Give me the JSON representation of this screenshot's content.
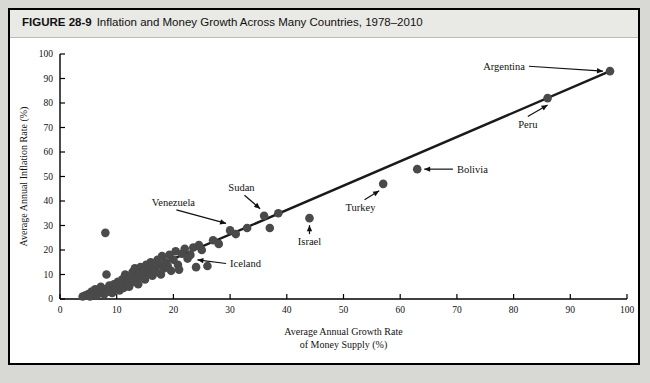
{
  "figure": {
    "number_label": "FIGURE 28-9",
    "title": "Inflation and Money Growth Across Many Countries, 1978–2010"
  },
  "colors": {
    "page_background": "#d8d8d4",
    "figure_background": "#ffffff",
    "header_band": "#e9e9e6",
    "border": "#000000",
    "dot": "#4a4a4a",
    "trend_line": "#1a1a1a",
    "text": "#111111"
  },
  "chart_data": {
    "type": "scatter",
    "title": "Inflation and Money Growth Across Many Countries, 1978–2010",
    "xlabel": "Average Annual Growth Rate of Money Supply (%)",
    "xlabel_line1": "Average Annual Growth Rate",
    "xlabel_line2": "of Money Supply (%)",
    "ylabel": "Average Annual Inflation Rate (%)",
    "xlim": [
      0,
      100
    ],
    "ylim": [
      0,
      100
    ],
    "xticks": [
      0,
      10,
      20,
      30,
      40,
      50,
      60,
      70,
      80,
      90,
      100
    ],
    "yticks": [
      0,
      10,
      20,
      30,
      40,
      50,
      60,
      70,
      80,
      90,
      100
    ],
    "grid": false,
    "legend": "none",
    "trend_line": {
      "label": "fitted line",
      "x": [
        4,
        97
      ],
      "y": [
        0.5,
        93
      ]
    },
    "points": [
      {
        "x": 4.0,
        "y": 1.0
      },
      {
        "x": 4.5,
        "y": 1.5
      },
      {
        "x": 5.0,
        "y": 2.0
      },
      {
        "x": 5.3,
        "y": 1.0
      },
      {
        "x": 5.6,
        "y": 3.0
      },
      {
        "x": 6.0,
        "y": 2.0
      },
      {
        "x": 6.2,
        "y": 4.0
      },
      {
        "x": 6.5,
        "y": 1.5
      },
      {
        "x": 6.8,
        "y": 3.0
      },
      {
        "x": 7.0,
        "y": 2.5
      },
      {
        "x": 7.2,
        "y": 5.0
      },
      {
        "x": 7.5,
        "y": 3.5
      },
      {
        "x": 7.8,
        "y": 2.0
      },
      {
        "x": 8.0,
        "y": 4.0
      },
      {
        "x": 8.0,
        "y": 27.0
      },
      {
        "x": 8.2,
        "y": 10.0
      },
      {
        "x": 8.4,
        "y": 3.0
      },
      {
        "x": 8.7,
        "y": 5.5
      },
      {
        "x": 9.0,
        "y": 4.5
      },
      {
        "x": 9.2,
        "y": 2.5
      },
      {
        "x": 9.5,
        "y": 6.0
      },
      {
        "x": 9.8,
        "y": 4.0
      },
      {
        "x": 10.0,
        "y": 5.0
      },
      {
        "x": 10.2,
        "y": 7.0
      },
      {
        "x": 10.5,
        "y": 3.5
      },
      {
        "x": 10.8,
        "y": 6.0
      },
      {
        "x": 11.0,
        "y": 8.0
      },
      {
        "x": 11.2,
        "y": 4.5
      },
      {
        "x": 11.5,
        "y": 10.0
      },
      {
        "x": 11.8,
        "y": 6.5
      },
      {
        "x": 12.0,
        "y": 7.5
      },
      {
        "x": 12.2,
        "y": 5.0
      },
      {
        "x": 12.5,
        "y": 9.0
      },
      {
        "x": 12.8,
        "y": 11.0
      },
      {
        "x": 13.0,
        "y": 7.0
      },
      {
        "x": 13.2,
        "y": 12.5
      },
      {
        "x": 13.5,
        "y": 8.5
      },
      {
        "x": 13.8,
        "y": 6.0
      },
      {
        "x": 14.0,
        "y": 10.0
      },
      {
        "x": 14.2,
        "y": 13.0
      },
      {
        "x": 14.5,
        "y": 9.0
      },
      {
        "x": 14.8,
        "y": 11.5
      },
      {
        "x": 15.0,
        "y": 8.0
      },
      {
        "x": 15.2,
        "y": 14.0
      },
      {
        "x": 15.5,
        "y": 10.5
      },
      {
        "x": 15.8,
        "y": 12.0
      },
      {
        "x": 16.0,
        "y": 15.0
      },
      {
        "x": 16.3,
        "y": 9.5
      },
      {
        "x": 16.6,
        "y": 13.0
      },
      {
        "x": 17.0,
        "y": 11.0
      },
      {
        "x": 17.2,
        "y": 16.0
      },
      {
        "x": 17.5,
        "y": 14.0
      },
      {
        "x": 17.8,
        "y": 10.0
      },
      {
        "x": 18.0,
        "y": 17.5
      },
      {
        "x": 18.3,
        "y": 12.5
      },
      {
        "x": 18.6,
        "y": 15.0
      },
      {
        "x": 19.0,
        "y": 13.5
      },
      {
        "x": 19.3,
        "y": 18.0
      },
      {
        "x": 19.6,
        "y": 11.5
      },
      {
        "x": 20.0,
        "y": 16.0
      },
      {
        "x": 20.4,
        "y": 19.5
      },
      {
        "x": 20.8,
        "y": 14.0
      },
      {
        "x": 21.0,
        "y": 12.0
      },
      {
        "x": 21.5,
        "y": 18.5
      },
      {
        "x": 22.0,
        "y": 20.5
      },
      {
        "x": 22.5,
        "y": 16.5
      },
      {
        "x": 23.0,
        "y": 18.0
      },
      {
        "x": 23.5,
        "y": 21.0
      },
      {
        "x": 24.0,
        "y": 13.0
      },
      {
        "x": 24.5,
        "y": 22.0
      },
      {
        "x": 25.0,
        "y": 20.0
      },
      {
        "x": 26.0,
        "y": 13.5
      },
      {
        "x": 27.0,
        "y": 24.0
      },
      {
        "x": 28.0,
        "y": 22.5
      },
      {
        "x": 30.0,
        "y": 28.0
      },
      {
        "x": 31.0,
        "y": 26.5
      },
      {
        "x": 33.0,
        "y": 29.0
      },
      {
        "x": 36.0,
        "y": 34.0
      },
      {
        "x": 37.0,
        "y": 29.0
      },
      {
        "x": 38.5,
        "y": 35.0
      },
      {
        "x": 44.0,
        "y": 33.0
      },
      {
        "x": 57.0,
        "y": 47.0
      },
      {
        "x": 63.0,
        "y": 53.0
      },
      {
        "x": 86.0,
        "y": 82.0
      },
      {
        "x": 97.0,
        "y": 93.0
      }
    ],
    "annotations": [
      {
        "name": "Argentina",
        "x": 97.0,
        "y": 93.0,
        "label_x": 82.0,
        "label_y": 95.0,
        "arrow_dir": "right"
      },
      {
        "name": "Peru",
        "x": 86.0,
        "y": 82.0,
        "label_x": 82.5,
        "label_y": 70.0,
        "arrow_dir": "up"
      },
      {
        "name": "Bolivia",
        "x": 63.0,
        "y": 53.0,
        "label_x": 70.0,
        "label_y": 53.0,
        "arrow_dir": "left"
      },
      {
        "name": "Turkey",
        "x": 57.0,
        "y": 47.0,
        "label_x": 53.0,
        "label_y": 36.0,
        "arrow_dir": "up-right"
      },
      {
        "name": "Israel",
        "x": 44.0,
        "y": 33.0,
        "label_x": 44.0,
        "label_y": 22.0,
        "arrow_dir": "up"
      },
      {
        "name": "Sudan",
        "x": 36.0,
        "y": 34.0,
        "label_x": 32.0,
        "label_y": 44.0,
        "arrow_dir": "down-right"
      },
      {
        "name": "Venezuela",
        "x": 30.0,
        "y": 28.0,
        "label_x": 20.0,
        "label_y": 38.0,
        "arrow_dir": "down-right"
      },
      {
        "name": "Iceland",
        "x": 23.0,
        "y": 16.0,
        "label_x": 30.0,
        "label_y": 14.5,
        "arrow_dir": "left"
      }
    ]
  }
}
